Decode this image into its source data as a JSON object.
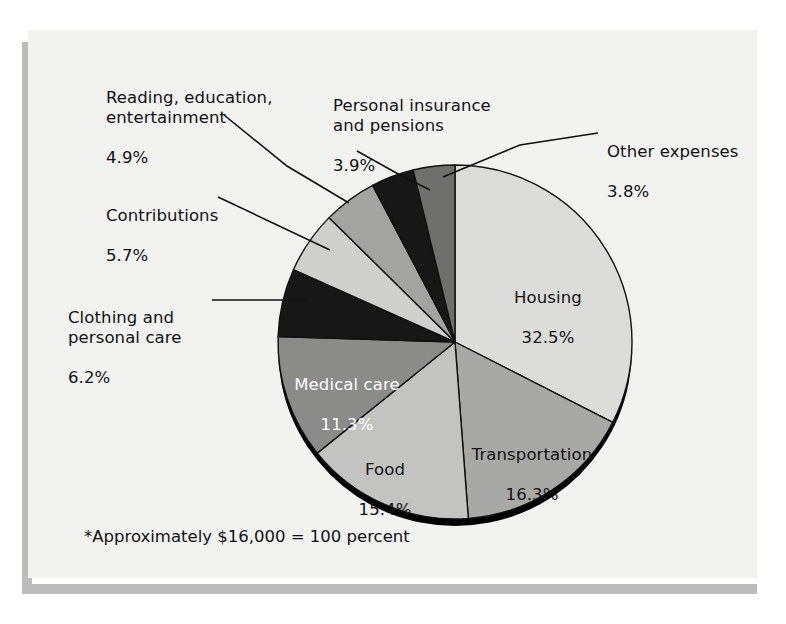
{
  "figure": {
    "footnote": "*Approximately $16,000 = 100 percent",
    "background_color": "#f2f2f1",
    "page_color": "#ffffff",
    "shadow_color": "#bcbcbc",
    "outline_color": "#111111",
    "rim_color": "#000000"
  },
  "chart_data": {
    "type": "pie",
    "title": "",
    "subtitle": "",
    "xlabel": "",
    "ylabel": "",
    "total_label": "*Approximately $16,000 = 100 percent",
    "units": "percent",
    "start_angle_deg": 0,
    "direction": "clockwise",
    "legend_position": "none",
    "grid": false,
    "categories": [
      "Housing",
      "Transportation",
      "Food",
      "Medical care",
      "Clothing and personal care",
      "Contributions",
      "Reading, education, entertainment",
      "Personal insurance and pensions",
      "Other expenses"
    ],
    "values": [
      32.5,
      16.3,
      15.4,
      11.3,
      6.2,
      5.7,
      4.9,
      3.9,
      3.8
    ],
    "colors": [
      "#dcdcda",
      "#a8a8a6",
      "#c3c3c1",
      "#8b8b89",
      "#171717",
      "#cfcfcd",
      "#a3a3a1",
      "#171717",
      "#6f6f6d"
    ],
    "slices": [
      {
        "name": "Housing",
        "value": 32.5,
        "value_text": "32.5%",
        "color": "#dcdcda",
        "label_placement": "inside",
        "text_color": "#111111"
      },
      {
        "name": "Transportation",
        "value": 16.3,
        "value_text": "16.3%",
        "color": "#a8a8a6",
        "label_placement": "inside",
        "text_color": "#111111"
      },
      {
        "name": "Food",
        "value": 15.4,
        "value_text": "15.4%",
        "color": "#c3c3c1",
        "label_placement": "inside",
        "text_color": "#111111"
      },
      {
        "name": "Medical care",
        "value": 11.3,
        "value_text": "11.3%",
        "color": "#8b8b89",
        "label_placement": "inside",
        "text_color": "#ffffff"
      },
      {
        "name": "Clothing and personal care",
        "value": 6.2,
        "value_text": "6.2%",
        "color": "#171717",
        "label_placement": "callout-left",
        "text_color": "#111111"
      },
      {
        "name": "Contributions",
        "value": 5.7,
        "value_text": "5.7%",
        "color": "#cfcfcd",
        "label_placement": "callout-left",
        "text_color": "#111111"
      },
      {
        "name": "Reading, education, entertainment",
        "value": 4.9,
        "value_text": "4.9%",
        "color": "#a3a3a1",
        "label_placement": "callout-top-left",
        "text_color": "#111111"
      },
      {
        "name": "Personal insurance and pensions",
        "value": 3.9,
        "value_text": "3.9%",
        "color": "#171717",
        "label_placement": "callout-top",
        "text_color": "#111111"
      },
      {
        "name": "Other expenses",
        "value": 3.8,
        "value_text": "3.8%",
        "color": "#6f6f6d",
        "label_placement": "callout-top-right",
        "text_color": "#111111"
      }
    ]
  },
  "labels": {
    "reading": {
      "name": "Reading, education,\nentertainment",
      "pct": "4.9%"
    },
    "personal_insurance": {
      "name": "Personal insurance\nand pensions",
      "pct": "3.9%"
    },
    "other_expenses": {
      "name": "Other expenses",
      "pct": "3.8%"
    },
    "contributions": {
      "name": "Contributions",
      "pct": "5.7%"
    },
    "clothing": {
      "name": "Clothing and\npersonal care",
      "pct": "6.2%"
    },
    "housing": {
      "name": "Housing",
      "pct": "32.5%"
    },
    "transportation": {
      "name": "Transportation",
      "pct": "16.3%"
    },
    "food": {
      "name": "Food",
      "pct": "15.4%"
    },
    "medical": {
      "name": "Medical care",
      "pct": "11.3%"
    }
  }
}
